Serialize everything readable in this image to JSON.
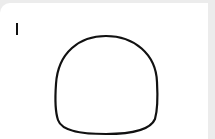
{
  "canvas": {
    "background": "#ffffff",
    "frame_color": "#ececec",
    "tool": "text-cursor",
    "stroke_color": "#111111",
    "stroke_width": 2.2,
    "shapes": [
      {
        "type": "freehand-dome",
        "path": "M56 84 C58 52 80 36 106 36 C134 36 156 54 157 82 C158 100 157 112 155 119 C150 131 128 134 106 134 C84 134 62 132 58 120 C55 111 55 98 56 84 Z"
      }
    ]
  }
}
